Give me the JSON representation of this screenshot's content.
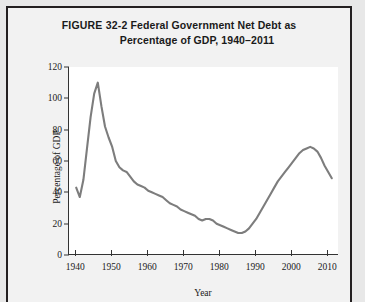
{
  "figure": {
    "number": "FIGURE 32-2",
    "title_line1": "Federal Government Net Debt as",
    "title_line2": "Percentage of GDP, 1940–2011"
  },
  "chart_data": {
    "type": "line",
    "title": "Federal Government Net Debt as Percentage of GDP, 1940–2011",
    "xlabel": "Year",
    "ylabel": "Percentage of GDP",
    "xlim": [
      1938,
      2013
    ],
    "ylim": [
      0,
      120
    ],
    "xticks": [
      1940,
      1950,
      1960,
      1970,
      1980,
      1990,
      2000,
      2010
    ],
    "yticks": [
      0,
      20,
      40,
      60,
      80,
      100,
      120
    ],
    "grid": false,
    "legend": null,
    "line_color": "#7d7d7d",
    "line_width": 2.1,
    "x": [
      1940,
      1941,
      1942,
      1943,
      1944,
      1945,
      1946,
      1947,
      1948,
      1949,
      1950,
      1951,
      1952,
      1953,
      1954,
      1955,
      1956,
      1957,
      1958,
      1959,
      1960,
      1961,
      1962,
      1963,
      1964,
      1965,
      1966,
      1967,
      1968,
      1969,
      1970,
      1971,
      1972,
      1973,
      1974,
      1975,
      1976,
      1977,
      1978,
      1979,
      1980,
      1981,
      1982,
      1983,
      1984,
      1985,
      1986,
      1987,
      1988,
      1989,
      1990,
      1991,
      1992,
      1993,
      1994,
      1995,
      1996,
      1997,
      1998,
      1999,
      2000,
      2001,
      2002,
      2003,
      2004,
      2005,
      2006,
      2007,
      2008,
      2009,
      2010,
      2011
    ],
    "y": [
      43,
      37,
      48,
      68,
      88,
      103,
      110,
      95,
      82,
      75,
      69,
      60,
      56,
      54,
      53,
      50,
      47,
      45,
      44,
      43,
      41,
      40,
      39,
      38,
      37,
      35,
      33,
      32,
      31,
      29,
      28,
      27,
      26,
      25,
      23,
      22,
      23,
      23,
      22,
      20,
      19,
      18,
      17,
      16,
      15,
      14,
      14,
      15,
      17,
      20,
      23,
      27,
      31,
      35,
      39,
      43,
      47,
      50,
      53,
      56,
      59,
      62,
      65,
      67,
      68,
      69,
      68,
      66,
      62,
      57,
      53,
      49
    ]
  },
  "axis_labels": {
    "y": [
      "0",
      "20",
      "40",
      "60",
      "80",
      "100",
      "120"
    ],
    "x": [
      "1940",
      "1950",
      "1960",
      "1970",
      "1980",
      "1990",
      "2000",
      "2010"
    ]
  }
}
